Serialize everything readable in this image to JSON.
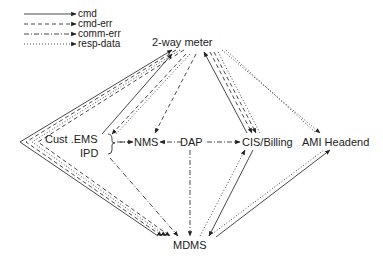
{
  "legend": {
    "items": [
      {
        "label": "cmd",
        "style": "solid"
      },
      {
        "label": "cmd-err",
        "style": "dashed"
      },
      {
        "label": "comm-err",
        "style": "dash-dot"
      },
      {
        "label": "resp-data",
        "style": "dotted"
      }
    ]
  },
  "nodes": {
    "meter": "2-way meter",
    "cust_ems": "Cust .EMS",
    "ipd": "IPD",
    "nms": "NMS",
    "dap": "DAP",
    "cis": "CIS/Billing",
    "ami": "AMI Headend",
    "mdms": "MDMS"
  },
  "edges": [
    {
      "from": "Cust .EMS",
      "to": "2-way meter",
      "style": "solid"
    },
    {
      "from": "2-way meter",
      "to": "Cust .EMS",
      "style": "dashed"
    },
    {
      "from": "2-way meter",
      "to": "NMS",
      "style": "dashed"
    },
    {
      "from": "CIS/Billing",
      "to": "2-way meter",
      "style": "solid"
    },
    {
      "from": "2-way meter",
      "to": "CIS/Billing",
      "style": "dashed"
    },
    {
      "from": "2-way meter",
      "to": "CIS/Billing",
      "style": "dotted"
    },
    {
      "from": "2-way meter",
      "to": "AMI Headend",
      "style": "dotted"
    },
    {
      "from": "DAP",
      "to": "NMS",
      "style": "dash-dot"
    },
    {
      "from": "DAP",
      "to": "CIS/Billing",
      "style": "dash-dot"
    },
    {
      "from": "Cust .EMS/IPD",
      "to": "NMS",
      "style": "dash-dot"
    },
    {
      "from": "DAP",
      "to": "MDMS",
      "style": "dash-dot"
    },
    {
      "from": "IPD",
      "to": "MDMS",
      "style": "dash-dot"
    },
    {
      "from": "MDMS",
      "to": "2-way meter",
      "style": "solid"
    },
    {
      "from": "2-way meter",
      "to": "MDMS",
      "style": "dashed"
    },
    {
      "from": "2-way meter",
      "to": "MDMS",
      "style": "dotted"
    },
    {
      "from": "CIS/Billing",
      "to": "MDMS",
      "style": "solid"
    },
    {
      "from": "MDMS",
      "to": "CIS/Billing",
      "style": "dotted"
    },
    {
      "from": "AMI Headend",
      "to": "MDMS",
      "style": "solid"
    },
    {
      "from": "MDMS",
      "to": "AMI Headend",
      "style": "dotted"
    }
  ]
}
